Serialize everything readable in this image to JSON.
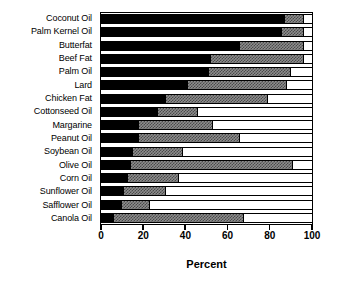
{
  "chart_data": {
    "type": "bar",
    "orientation": "horizontal",
    "stacked": true,
    "title": "",
    "xlabel": "Percent",
    "ylabel": "",
    "xlim": [
      0,
      100
    ],
    "xticks": [
      0,
      20,
      40,
      60,
      80,
      100
    ],
    "xticklabels": [
      "0",
      "20",
      "40",
      "60",
      "80",
      "100"
    ],
    "grid": false,
    "legend": "none",
    "categories": [
      "Coconut Oil",
      "Palm Kernel Oil",
      "Butterfat",
      "Beef Fat",
      "Palm Oil",
      "Lard",
      "Chicken Fat",
      "Cottonseed Oil",
      "Margarine",
      "Peanut Oil",
      "Soybean Oil",
      "Olive Oil",
      "Corn Oil",
      "Sunflower Oil",
      "Safflower Oil",
      "Canola Oil"
    ],
    "series": [
      {
        "name": "Saturated Fat",
        "color": "#000000",
        "fill": "solid-black",
        "values": [
          87,
          86,
          66,
          52,
          51,
          41,
          31,
          27,
          18,
          18,
          15,
          14,
          13,
          11,
          10,
          6
        ]
      },
      {
        "name": "Monounsaturated Fat",
        "color": "#808080",
        "fill": "checkered-gray",
        "values": [
          9,
          10,
          30,
          44,
          39,
          47,
          48,
          19,
          35,
          48,
          24,
          77,
          24,
          20,
          13,
          62
        ]
      },
      {
        "name": "Polyunsaturated Fat",
        "color": "#ffffff",
        "fill": "white",
        "values": [
          4,
          4,
          4,
          4,
          10,
          12,
          21,
          54,
          47,
          34,
          61,
          9,
          63,
          69,
          77,
          32
        ]
      }
    ]
  },
  "axis": {
    "xtitle": "Percent"
  }
}
